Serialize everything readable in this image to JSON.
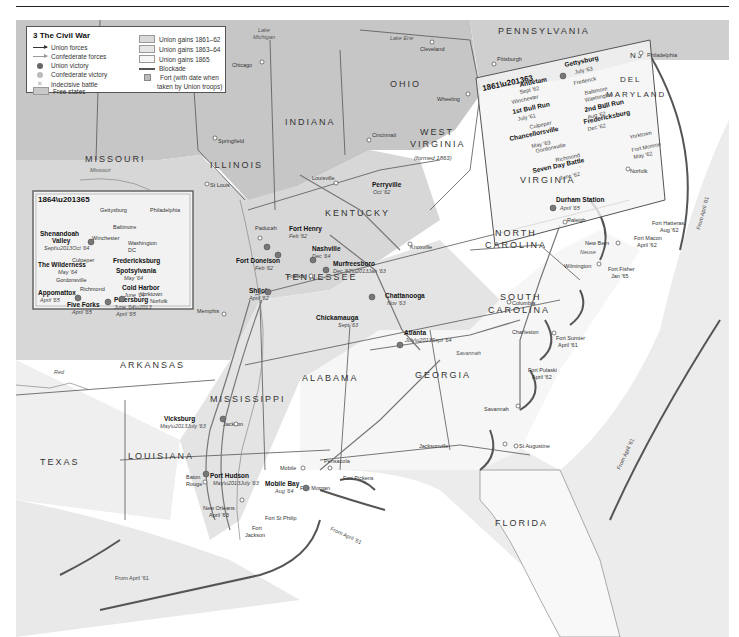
{
  "legend": {
    "title": "3 The Civil War",
    "items": [
      {
        "label": "Union forces",
        "symbol": "arrow-dark"
      },
      {
        "label": "Confederate forces",
        "symbol": "arrow-light"
      },
      {
        "label": "Union victory",
        "symbol": "union-victory-icon"
      },
      {
        "label": "Confederate victory",
        "symbol": "confederate-victory-icon"
      },
      {
        "label": "Indecisive battle",
        "symbol": "cross-icon"
      },
      {
        "label": "Free states",
        "symbol": "swatch",
        "color": "#c8c8c8"
      },
      {
        "label": "Union gains 1861–62",
        "symbol": "swatch",
        "color": "#d9d9d9"
      },
      {
        "label": "Union gains 1863–64",
        "symbol": "swatch",
        "color": "#e6e6e6"
      },
      {
        "label": "Union gains 1865",
        "symbol": "swatch",
        "color": "#f4f4f4"
      },
      {
        "label": "Blockade",
        "symbol": "line"
      },
      {
        "label": "Fort (with date when",
        "symbol": "fort-icon"
      },
      {
        "label": "taken by Union troops)",
        "symbol": "none"
      }
    ]
  },
  "colors": {
    "free_states": "#c6c6c6",
    "gains_1861": "#d6d6d6",
    "gains_1863": "#e4e4e4",
    "gains_1865": "#f5f5f5",
    "sea": "#e8e8e8",
    "blockade": "#555555",
    "border": "#444444"
  },
  "states": [
    {
      "name": "MISSOURI"
    },
    {
      "name": "ILLINOIS"
    },
    {
      "name": "INDIANA"
    },
    {
      "name": "OHIO"
    },
    {
      "name": "PENNSYLVANIA"
    },
    {
      "name": "WEST VIRGINIA"
    },
    {
      "name": "(formed 1863)"
    },
    {
      "name": "KENTUCKY"
    },
    {
      "name": "TENNESSEE"
    },
    {
      "name": "VIRGINIA"
    },
    {
      "name": "NORTH CAROLINA"
    },
    {
      "name": "SOUTH CAROLINA"
    },
    {
      "name": "GEORGIA"
    },
    {
      "name": "ALABAMA"
    },
    {
      "name": "MISSISSIPPI"
    },
    {
      "name": "ARKANSAS"
    },
    {
      "name": "LOUISIANA"
    },
    {
      "name": "TEXAS"
    },
    {
      "name": "FLORIDA"
    },
    {
      "name": "MARYLAND"
    },
    {
      "name": "DEL"
    },
    {
      "name": "NJ"
    }
  ],
  "water": [
    "Lake Michigan",
    "Lake Erie",
    "Missouri",
    "Mississippi",
    "Ohio",
    "Tennessee",
    "Red",
    "Savannah",
    "Neuse"
  ],
  "cities": [
    "Chicago",
    "Cleveland",
    "Pittsburgh",
    "Philadelphia",
    "Springfield",
    "Cincinnati",
    "Wheeling",
    "St Louis",
    "Louisville",
    "Paducah",
    "Memphis",
    "Franklin",
    "Knoxville",
    "Jackson",
    "Baton Rouge",
    "New Orleans",
    "Mobile",
    "Pensacola",
    "Jacksonville",
    "St Augustine",
    "Savannah",
    "Charleston",
    "Columbia",
    "Wilmington",
    "New Bern",
    "Raleigh",
    "Norfolk",
    "Richmond",
    "Yorktown"
  ],
  "battles": [
    {
      "name": "Perryville",
      "date": "Oct '62"
    },
    {
      "name": "Fort Henry",
      "date": "Feb '62"
    },
    {
      "name": "Fort Donelson",
      "date": "Feb '62"
    },
    {
      "name": "Nashville",
      "date": "Dec '64"
    },
    {
      "name": "Murfreesboro",
      "date": "Dec '62–Jan '63"
    },
    {
      "name": "Shiloh",
      "date": "April '62"
    },
    {
      "name": "Chattanooga",
      "date": "Nov '63"
    },
    {
      "name": "Chickamauga",
      "date": "Sept '63"
    },
    {
      "name": "Atlanta",
      "date": "July–Sept '64"
    },
    {
      "name": "Vicksburg",
      "date": "May–July '63"
    },
    {
      "name": "Port Hudson",
      "date": "May–July '63"
    },
    {
      "name": "Mobile Bay",
      "date": "Aug '64"
    },
    {
      "name": "Durham Station",
      "date": "April '65"
    }
  ],
  "forts": [
    {
      "name": "Fort Hatteras",
      "date": "Aug '62"
    },
    {
      "name": "Fort Macon",
      "date": "April '62"
    },
    {
      "name": "Fort Fisher",
      "date": "Jan '65"
    },
    {
      "name": "Fort Sumter",
      "date": "April '61"
    },
    {
      "name": "Fort Pulaski",
      "date": "April '62"
    },
    {
      "name": "Fort Pickens",
      "date": ""
    },
    {
      "name": "Fort Morgan",
      "date": ""
    },
    {
      "name": "Fort St Philip",
      "date": ""
    },
    {
      "name": "Fort Jackson",
      "date": ""
    },
    {
      "name": "New Orleans",
      "date": "April '63"
    }
  ],
  "blockade_label": "From April '61",
  "inset_1861": {
    "title": "1861–63",
    "battles": [
      {
        "name": "Gettysburg",
        "date": "July '63"
      },
      {
        "name": "Antietam",
        "date": "Sept '62"
      },
      {
        "name": "1st Bull Run",
        "date": "July '61"
      },
      {
        "name": "2nd Bull Run",
        "date": "Aug '62"
      },
      {
        "name": "Fredericksburg",
        "date": "Dec '62"
      },
      {
        "name": "Chancellorsville",
        "date": "May '63"
      },
      {
        "name": "Seven Day Battle",
        "date": "June '62"
      },
      {
        "name": "Fort Monroe",
        "date": "May '62"
      }
    ],
    "places": [
      "Frederick",
      "Baltimore",
      "Washington DC",
      "Winchester",
      "Culpeper",
      "Gordonsville",
      "Richmond",
      "Yorktown",
      "Norfolk"
    ]
  },
  "inset_1864": {
    "title": "1864–65",
    "battles": [
      {
        "name": "Shenandoah Valley",
        "date": "Sept–Oct '64"
      },
      {
        "name": "The Wilderness",
        "date": "May '64"
      },
      {
        "name": "Fredericksburg",
        "date": ""
      },
      {
        "name": "Spotsylvania",
        "date": "May '64"
      },
      {
        "name": "Cold Harbor",
        "date": "June '64"
      },
      {
        "name": "Appomattox",
        "date": "April '65"
      },
      {
        "name": "Five Forks",
        "date": "April '65"
      },
      {
        "name": "Petersburg",
        "date": "June '64–April '65"
      }
    ],
    "places": [
      "Gettysburg",
      "Philadelphia",
      "Baltimore",
      "Winchester",
      "Washington DC",
      "Culpeper",
      "Gordonsville",
      "Richmond",
      "Yorktown",
      "Norfolk"
    ]
  },
  "graticule": [
    "80°",
    "90°",
    "40°",
    "30°"
  ]
}
